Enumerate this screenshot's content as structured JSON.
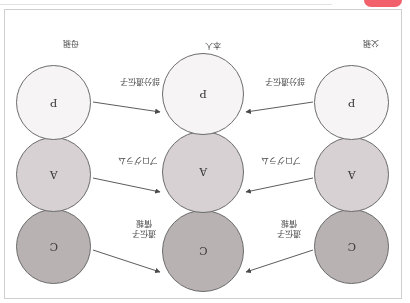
{
  "figure": {
    "orientation_note": "rotated-180",
    "nodes": {
      "father": [
        {
          "id": "father-c",
          "glyph": "C",
          "fill": "#b9b2b2"
        },
        {
          "id": "father-a",
          "glyph": "A",
          "fill": "#d7d1d4"
        },
        {
          "id": "father-p",
          "glyph": "P",
          "fill": "#f7f4f6"
        }
      ],
      "self": [
        {
          "id": "self-c",
          "glyph": "C",
          "fill": "#b9b2b2"
        },
        {
          "id": "self-a",
          "glyph": "A",
          "fill": "#d7d1d4"
        },
        {
          "id": "self-p",
          "glyph": "P",
          "fill": "#f7f4f6"
        }
      ],
      "mother": [
        {
          "id": "mother-c",
          "glyph": "C",
          "fill": "#b9b2b2"
        },
        {
          "id": "mother-a",
          "glyph": "A",
          "fill": "#d7d1d4"
        },
        {
          "id": "mother-p",
          "glyph": "P",
          "fill": "#f7f4f6"
        }
      ]
    },
    "labels": {
      "father": "父親",
      "mother": "母親",
      "self": "本人",
      "edge_top_left": "遺伝子\n情報",
      "edge_top_left_line1": "遺伝子",
      "edge_top_left_line2": "情報",
      "edge_top_right_line1": "遺伝子",
      "edge_top_right_line2": "情報",
      "edge_mid_left": "プログラム",
      "edge_mid_right": "プログラム",
      "edge_bottom_left": "部分遺伝子",
      "edge_bottom_right": "部分遺伝子"
    }
  },
  "chrome": {
    "pink_badge_color": "#f2606b"
  }
}
